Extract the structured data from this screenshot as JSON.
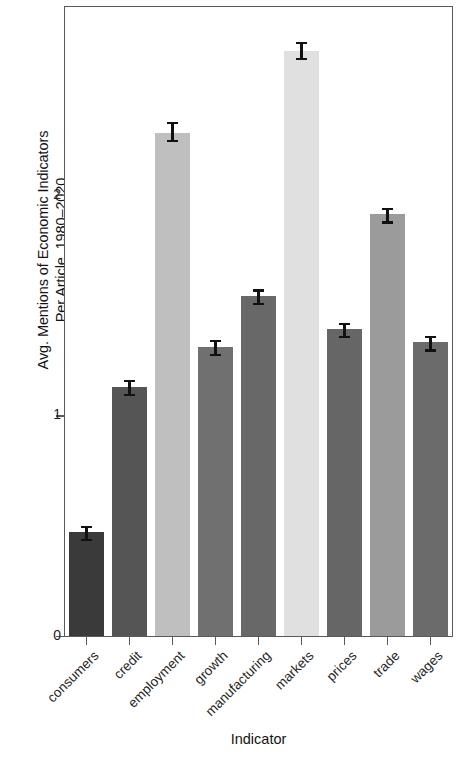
{
  "chart_data": {
    "type": "bar",
    "title": "",
    "xlabel": "Indicator",
    "ylabel": "Avg. Mentions of Economic Indicators Per Article, 1980–2020",
    "ylabel_lines": [
      "Avg. Mentions of Economic Indicators",
      "Per Article, 1980–2020"
    ],
    "categories": [
      "consumers",
      "credit",
      "employment",
      "growth",
      "manufacturing",
      "markets",
      "prices",
      "trade",
      "wages"
    ],
    "values": [
      0.47,
      1.13,
      2.28,
      1.31,
      1.54,
      2.65,
      1.39,
      1.91,
      1.33
    ],
    "errors": [
      0.03,
      0.03,
      0.05,
      0.03,
      0.03,
      0.04,
      0.03,
      0.03,
      0.03
    ],
    "bar_colors": [
      "#3a3a3a",
      "#555555",
      "#bfbfbf",
      "#707070",
      "#686868",
      "#e0e0e0",
      "#666666",
      "#9b9b9b",
      "#6b6b6b"
    ],
    "ylim": [
      0,
      2.85
    ],
    "yticks": [
      0,
      1,
      2
    ],
    "ytick_labels": [
      "0",
      "1",
      "2"
    ],
    "grid": false,
    "legend": "none",
    "error_bar_color": "#111111",
    "axis_color": "#5a5a5a"
  }
}
